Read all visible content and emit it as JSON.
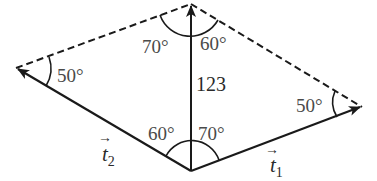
{
  "diagram": {
    "type": "vector-parallelogram",
    "colors": {
      "stroke": "#1a1a1a",
      "text": "#4a4a4a",
      "background": "#ffffff"
    },
    "vertices": {
      "top": {
        "x": 191,
        "y": 4
      },
      "bottom": {
        "x": 191,
        "y": 171
      },
      "left": {
        "x": 16,
        "y": 68
      },
      "right": {
        "x": 362,
        "y": 107
      }
    },
    "vectors": {
      "resultant": {
        "label": "123",
        "from": "bottom",
        "to": "top"
      },
      "t1": {
        "symbol": "t",
        "subscript": "1",
        "arrow": "→",
        "from": "bottom",
        "to": "right"
      },
      "t2": {
        "symbol": "t",
        "subscript": "2",
        "arrow": "→",
        "from": "bottom",
        "to": "left"
      }
    },
    "dashed_edges": [
      {
        "from": "left",
        "to": "top"
      },
      {
        "from": "top",
        "to": "right"
      }
    ],
    "angles": {
      "top_left": "70°",
      "top_right": "60°",
      "left": "50°",
      "right": "50°",
      "bottom_left": "60°",
      "bottom_right": "70°"
    }
  }
}
